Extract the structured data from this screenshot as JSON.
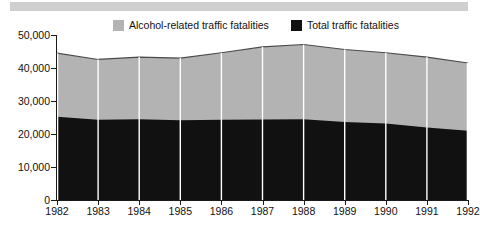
{
  "legend": {
    "items": [
      {
        "label": "Alcohol-related traffic fatalities",
        "color": "#b3b3b3",
        "swatch_name": "legend-swatch-alcohol"
      },
      {
        "label": "Total traffic fatalities",
        "color": "#111111",
        "swatch_name": "legend-swatch-total"
      }
    ]
  },
  "axes": {
    "y_ticks": [
      "0",
      "10,000",
      "20,000",
      "30,000",
      "40,000",
      "50,000"
    ],
    "x_ticks": [
      "1982",
      "1983",
      "1984",
      "1985",
      "1986",
      "1987",
      "1988",
      "1989",
      "1990",
      "1991",
      "1992"
    ]
  },
  "chart_data": {
    "type": "area",
    "title": "",
    "subtitle": "",
    "xlabel": "",
    "ylabel": "",
    "stacked": false,
    "grid": false,
    "legend_position": "top",
    "ylim": [
      0,
      50000
    ],
    "ytick_values": [
      0,
      10000,
      20000,
      30000,
      40000,
      50000
    ],
    "ytick_labels": [
      "0",
      "10,000",
      "20,000",
      "30,000",
      "40,000",
      "50,000"
    ],
    "categories": [
      "1982",
      "1983",
      "1984",
      "1985",
      "1986",
      "1987",
      "1988",
      "1989",
      "1990",
      "1991",
      "1992"
    ],
    "x": [
      1982,
      1983,
      1984,
      1985,
      1986,
      1987,
      1988,
      1989,
      1990,
      1991,
      1992
    ],
    "series": [
      {
        "name": "Alcohol-related traffic fatalities",
        "color": "#b3b3b3",
        "note": "upper band; values are the total envelope height at each year",
        "values": [
          44500,
          42600,
          43300,
          43000,
          44600,
          46400,
          47100,
          45600,
          44600,
          43300,
          41500
        ]
      },
      {
        "name": "Total traffic fatalities",
        "color": "#111111",
        "note": "lower black band measured from zero",
        "values": [
          25200,
          24300,
          24500,
          24200,
          24300,
          24400,
          24500,
          23600,
          23200,
          22000,
          21000
        ]
      }
    ],
    "vertical_separators": true
  },
  "colors": {
    "alcohol_band": "#b3b3b3",
    "total_band": "#111111",
    "axis": "#1a1a1a",
    "background": "#ffffff",
    "separator": "#ffffff",
    "scan_strip": "#cfcfcf"
  }
}
